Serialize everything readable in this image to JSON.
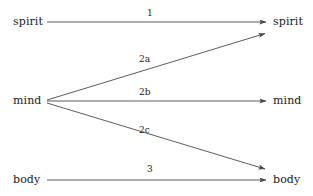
{
  "diagram": {
    "background_color": "#ffffff",
    "line_color": "#4a4a4a",
    "text_color": "#1c1c1c",
    "nodes": {
      "left": [
        {
          "id": "left-spirit",
          "label": "spirit",
          "x": 13,
          "y": 16
        },
        {
          "id": "left-mind",
          "label": "mind",
          "x": 13,
          "y": 95
        },
        {
          "id": "left-body",
          "label": "body",
          "x": 13,
          "y": 174
        }
      ],
      "right": [
        {
          "id": "right-spirit",
          "label": "spirit",
          "x": 273,
          "y": 16
        },
        {
          "id": "right-mind",
          "label": "mind",
          "x": 273,
          "y": 95
        },
        {
          "id": "right-body",
          "label": "body",
          "x": 273,
          "y": 174
        }
      ]
    },
    "edges": [
      {
        "id": "edge-1",
        "label": "1",
        "from": "left-spirit",
        "to": "right-spirit",
        "x1": 47,
        "y1": 22,
        "x2": 268,
        "y2": 22,
        "label_x": 147,
        "label_y": 8
      },
      {
        "id": "edge-2a",
        "label": "2a",
        "from": "left-mind",
        "to": "right-spirit",
        "x1": 47,
        "y1": 100,
        "x2": 268,
        "y2": 33,
        "label_x": 139,
        "label_y": 54
      },
      {
        "id": "edge-2b",
        "label": "2b",
        "from": "left-mind",
        "to": "right-mind",
        "x1": 47,
        "y1": 101,
        "x2": 268,
        "y2": 101,
        "label_x": 139,
        "label_y": 87
      },
      {
        "id": "edge-2c",
        "label": "2c",
        "from": "left-mind",
        "to": "right-body",
        "x1": 47,
        "y1": 103,
        "x2": 268,
        "y2": 170,
        "label_x": 139,
        "label_y": 125
      },
      {
        "id": "edge-3",
        "label": "3",
        "from": "left-body",
        "to": "right-body",
        "x1": 47,
        "y1": 180,
        "x2": 268,
        "y2": 180,
        "label_x": 147,
        "label_y": 164
      }
    ]
  }
}
